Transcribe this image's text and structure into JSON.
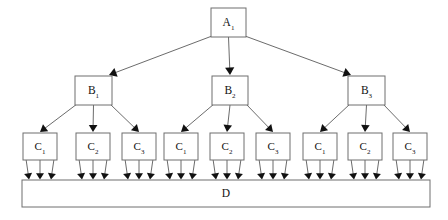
{
  "diagram": {
    "type": "hierarchy-tree",
    "title": "",
    "background_color": "#ffffff",
    "node_fill": "#ffffff",
    "node_stroke": "#6e6e6e",
    "edge_color": "#5a5a5a",
    "arrowhead_color": "#111111",
    "levels": 4,
    "root": {
      "id": "A1",
      "base": "A",
      "subscript": "1",
      "x": 211,
      "y": 8,
      "w": 35,
      "h": 29
    },
    "level_b": [
      {
        "id": "B1",
        "base": "B",
        "subscript": "1",
        "x": 75,
        "y": 76,
        "w": 37,
        "h": 29
      },
      {
        "id": "B2",
        "base": "B",
        "subscript": "2",
        "x": 212,
        "y": 76,
        "w": 36,
        "h": 29
      },
      {
        "id": "B3",
        "base": "B",
        "subscript": "3",
        "x": 348,
        "y": 76,
        "w": 37,
        "h": 29
      }
    ],
    "level_c": [
      {
        "id": "C1a",
        "base": "C",
        "subscript": "1",
        "parent": "B1",
        "x": 23,
        "y": 133,
        "w": 34,
        "h": 27
      },
      {
        "id": "C2a",
        "base": "C",
        "subscript": "2",
        "parent": "B1",
        "x": 76,
        "y": 133,
        "w": 34,
        "h": 27
      },
      {
        "id": "C3a",
        "base": "C",
        "subscript": "3",
        "parent": "B1",
        "x": 122,
        "y": 133,
        "w": 34,
        "h": 27
      },
      {
        "id": "C1b",
        "base": "C",
        "subscript": "1",
        "parent": "B2",
        "x": 164,
        "y": 133,
        "w": 34,
        "h": 27
      },
      {
        "id": "C2b",
        "base": "C",
        "subscript": "2",
        "parent": "B2",
        "x": 210,
        "y": 133,
        "w": 34,
        "h": 27
      },
      {
        "id": "C3b",
        "base": "C",
        "subscript": "3",
        "parent": "B2",
        "x": 256,
        "y": 133,
        "w": 34,
        "h": 27
      },
      {
        "id": "C1c",
        "base": "C",
        "subscript": "1",
        "parent": "B3",
        "x": 303,
        "y": 133,
        "w": 34,
        "h": 27
      },
      {
        "id": "C2c",
        "base": "C",
        "subscript": "2",
        "parent": "B3",
        "x": 348,
        "y": 133,
        "w": 34,
        "h": 27
      },
      {
        "id": "C3c",
        "base": "C",
        "subscript": "3",
        "parent": "B3",
        "x": 393,
        "y": 133,
        "w": 34,
        "h": 27
      }
    ],
    "sink": {
      "id": "D",
      "base": "D",
      "subscript": "",
      "x": 22,
      "y": 180,
      "w": 408,
      "h": 27
    },
    "edges": {
      "a_to_b_count": 3,
      "b_to_c_count": 9,
      "c_to_d_count": 27,
      "total": 39
    }
  }
}
